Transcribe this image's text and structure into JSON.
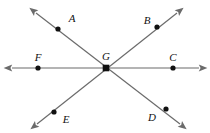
{
  "figure": {
    "type": "geometry-diagram",
    "background_color": "#ffffff",
    "line_color": "#6b6b6b",
    "point_color": "#111111",
    "label_color": "#111111",
    "line_width": 1.2,
    "point_radius": 2.6,
    "width": 210,
    "height": 133
  },
  "intersection": {
    "name": "G",
    "label": "G",
    "x": 106,
    "y": 68,
    "label_x": 106,
    "label_y": 60
  },
  "lines": [
    {
      "name": "line-AD",
      "label": "AD",
      "from_label": "A",
      "to_label": "D",
      "x1": 36,
      "y1": 13,
      "x2": 180,
      "y2": 124
    },
    {
      "name": "line-BE",
      "label": "BE",
      "from_label": "B",
      "to_label": "E",
      "x1": 177,
      "y1": 13,
      "x2": 37,
      "y2": 124
    },
    {
      "name": "line-FC",
      "label": "FC",
      "from_label": "F",
      "to_label": "C",
      "x1": 12,
      "y1": 68,
      "x2": 199,
      "y2": 68
    }
  ],
  "points": [
    {
      "name": "point-a",
      "label": "A",
      "x": 58,
      "y": 29,
      "label_x": 72,
      "label_y": 22
    },
    {
      "name": "point-b",
      "label": "B",
      "x": 157,
      "y": 27,
      "label_x": 147,
      "label_y": 24
    },
    {
      "name": "point-c",
      "label": "C",
      "x": 173,
      "y": 68,
      "label_x": 173,
      "label_y": 61
    },
    {
      "name": "point-d",
      "label": "D",
      "x": 166,
      "y": 109,
      "label_x": 152,
      "label_y": 121
    },
    {
      "name": "point-e",
      "label": "E",
      "x": 54,
      "y": 112,
      "label_x": 66,
      "label_y": 123
    },
    {
      "name": "point-f",
      "label": "F",
      "x": 38,
      "y": 68,
      "label_x": 38,
      "label_y": 61
    }
  ]
}
